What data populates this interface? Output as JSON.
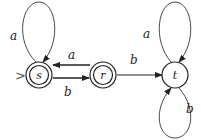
{
  "diagram": {
    "type": "finite-automaton",
    "states": [
      {
        "id": "s",
        "label": "s",
        "accepting": true,
        "start": true
      },
      {
        "id": "r",
        "label": "r",
        "accepting": true,
        "start": false
      },
      {
        "id": "t",
        "label": "t",
        "accepting": false,
        "start": false
      }
    ],
    "start_marker": ">",
    "transitions": [
      {
        "from": "s",
        "to": "s",
        "label": "a"
      },
      {
        "from": "s",
        "to": "r",
        "label": "b"
      },
      {
        "from": "r",
        "to": "s",
        "label": "a"
      },
      {
        "from": "r",
        "to": "t",
        "label": "b"
      },
      {
        "from": "t",
        "to": "t",
        "label": "a"
      },
      {
        "from": "t",
        "to": "t",
        "label": "b"
      }
    ]
  }
}
